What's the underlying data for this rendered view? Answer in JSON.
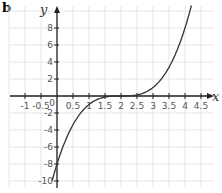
{
  "panel_label": "b",
  "chart_data": {
    "type": "line",
    "title": "",
    "xlabel": "x",
    "ylabel": "y",
    "xlim": [
      -1.2,
      4.9
    ],
    "ylim": [
      -10.8,
      10.5
    ],
    "grid": true,
    "x_ticks": [
      "-1",
      "-0.5",
      "0",
      "0.5",
      "1",
      "1.5",
      "2",
      "2.5",
      "3",
      "3.5",
      "4",
      "4.5"
    ],
    "y_ticks": [
      "8",
      "6",
      "4",
      "2",
      "-2",
      "-4",
      "-6",
      "-8",
      "-10"
    ],
    "series": [
      {
        "name": "curve",
        "description": "cubic-like curve, flat near y=0 between x=1.5 and x=2.5",
        "x": [
          -0.15,
          0,
          0.5,
          1,
          1.5,
          2,
          2.5,
          3,
          3.5,
          4,
          4.2
        ],
        "y": [
          -10,
          -8,
          -3.4,
          -1,
          -0.1,
          0,
          0.1,
          1,
          3.4,
          8,
          10
        ]
      }
    ]
  }
}
